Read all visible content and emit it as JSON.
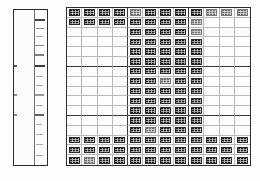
{
  "figure": {
    "kind": "two-panel-grayscale-array",
    "background_color": "#ffffff",
    "border_color": "#2e2e2e"
  },
  "left_panel": {
    "name": "marker-lane-panel",
    "x": 13,
    "y": 9,
    "width": 35,
    "height": 157,
    "divider_x_fraction": 0.62,
    "band_color": "#3a3a3a",
    "bands": [
      {
        "y_fraction": 0.055,
        "height": 0.013,
        "x_fraction": 0.64,
        "width": 0.3,
        "intensity": 0.95
      },
      {
        "y_fraction": 0.115,
        "height": 0.008,
        "x_fraction": 0.66,
        "width": 0.24,
        "intensity": 0.55
      },
      {
        "y_fraction": 0.168,
        "height": 0.008,
        "x_fraction": 0.66,
        "width": 0.22,
        "intensity": 0.45
      },
      {
        "y_fraction": 0.225,
        "height": 0.008,
        "x_fraction": 0.65,
        "width": 0.26,
        "intensity": 0.6
      },
      {
        "y_fraction": 0.285,
        "height": 0.009,
        "x_fraction": 0.65,
        "width": 0.27,
        "intensity": 0.65
      },
      {
        "y_fraction": 0.352,
        "height": 0.016,
        "x_fraction": 0.63,
        "width": 0.31,
        "intensity": 1.0
      },
      {
        "y_fraction": 0.352,
        "height": 0.014,
        "x_fraction": 0.0,
        "width": 0.1,
        "intensity": 0.85
      },
      {
        "y_fraction": 0.425,
        "height": 0.007,
        "x_fraction": 0.66,
        "width": 0.22,
        "intensity": 0.42
      },
      {
        "y_fraction": 0.485,
        "height": 0.007,
        "x_fraction": 0.66,
        "width": 0.22,
        "intensity": 0.4
      },
      {
        "y_fraction": 0.545,
        "height": 0.008,
        "x_fraction": 0.65,
        "width": 0.25,
        "intensity": 0.5
      },
      {
        "y_fraction": 0.545,
        "height": 0.01,
        "x_fraction": 0.0,
        "width": 0.08,
        "intensity": 0.6
      },
      {
        "y_fraction": 0.612,
        "height": 0.008,
        "x_fraction": 0.66,
        "width": 0.23,
        "intensity": 0.45
      },
      {
        "y_fraction": 0.672,
        "height": 0.012,
        "x_fraction": 0.64,
        "width": 0.28,
        "intensity": 0.8
      },
      {
        "y_fraction": 0.672,
        "height": 0.011,
        "x_fraction": 0.0,
        "width": 0.08,
        "intensity": 0.62
      },
      {
        "y_fraction": 0.735,
        "height": 0.007,
        "x_fraction": 0.66,
        "width": 0.2,
        "intensity": 0.38
      },
      {
        "y_fraction": 0.8,
        "height": 0.008,
        "x_fraction": 0.66,
        "width": 0.22,
        "intensity": 0.42
      },
      {
        "y_fraction": 0.866,
        "height": 0.007,
        "x_fraction": 0.66,
        "width": 0.22,
        "intensity": 0.4
      },
      {
        "y_fraction": 0.935,
        "height": 0.008,
        "x_fraction": 0.66,
        "width": 0.23,
        "intensity": 0.45
      }
    ]
  },
  "right_panel": {
    "name": "blot-array-panel",
    "x": 66,
    "y": 7,
    "width": 185,
    "height": 159,
    "columns": 12,
    "rows": 16,
    "major_column_breaks": [
      4,
      8
    ],
    "major_row_breaks": [
      6,
      11
    ],
    "cell_fill_color": "#1d1d1d",
    "grid_line_color": "#b9b9b9",
    "major_grid_line_color": "#3a3a3a",
    "occupancy": [
      [
        1,
        1,
        1,
        1,
        1,
        1,
        1,
        1,
        1,
        1,
        1,
        1
      ],
      [
        1,
        1,
        1,
        1,
        1,
        1,
        1,
        1,
        1,
        0,
        0,
        0
      ],
      [
        0,
        0,
        0,
        0,
        1,
        1,
        1,
        1,
        1,
        0,
        0,
        0
      ],
      [
        0,
        0,
        0,
        0,
        1,
        1,
        1,
        1,
        1,
        0,
        0,
        0
      ],
      [
        0,
        0,
        0,
        0,
        1,
        1,
        1,
        1,
        1,
        0,
        0,
        0
      ],
      [
        0,
        0,
        0,
        0,
        1,
        1,
        1,
        1,
        1,
        0,
        0,
        0
      ],
      [
        0,
        0,
        0,
        0,
        1,
        1,
        1,
        1,
        1,
        0,
        0,
        0
      ],
      [
        0,
        0,
        0,
        0,
        1,
        1,
        1,
        1,
        1,
        0,
        0,
        0
      ],
      [
        0,
        0,
        0,
        0,
        1,
        1,
        1,
        1,
        1,
        0,
        0,
        0
      ],
      [
        0,
        0,
        0,
        0,
        1,
        1,
        1,
        1,
        1,
        0,
        0,
        0
      ],
      [
        0,
        0,
        0,
        0,
        1,
        1,
        1,
        1,
        1,
        0,
        0,
        0
      ],
      [
        0,
        0,
        0,
        0,
        1,
        1,
        1,
        1,
        1,
        0,
        0,
        0
      ],
      [
        0,
        0,
        0,
        0,
        1,
        1,
        1,
        1,
        1,
        0,
        0,
        0
      ],
      [
        1,
        1,
        1,
        1,
        1,
        1,
        1,
        1,
        1,
        1,
        1,
        1
      ],
      [
        1,
        1,
        1,
        1,
        1,
        1,
        1,
        1,
        1,
        1,
        1,
        1
      ],
      [
        1,
        1,
        1,
        1,
        1,
        1,
        1,
        1,
        1,
        1,
        1,
        1
      ]
    ],
    "intensity": [
      [
        1.0,
        1.0,
        1.0,
        1.0,
        0.85,
        1.0,
        1.0,
        1.0,
        1.0,
        0.8,
        0.8,
        0.75
      ],
      [
        1.0,
        1.0,
        1.0,
        1.0,
        1.0,
        1.0,
        1.0,
        1.0,
        0.9,
        0,
        0,
        0
      ],
      [
        0,
        0,
        0,
        0,
        1.0,
        1.0,
        1.0,
        1.0,
        0.9,
        0,
        0,
        0
      ],
      [
        0,
        0,
        0,
        0,
        1.0,
        1.0,
        1.0,
        1.0,
        1.0,
        0,
        0,
        0
      ],
      [
        0,
        0,
        0,
        0,
        1.0,
        1.0,
        1.0,
        1.0,
        1.0,
        0,
        0,
        0
      ],
      [
        0,
        0,
        0,
        0,
        1.0,
        1.0,
        1.0,
        1.0,
        1.0,
        0,
        0,
        0
      ],
      [
        0,
        0,
        0,
        0,
        1.0,
        1.0,
        1.0,
        1.0,
        1.0,
        0,
        0,
        0
      ],
      [
        0,
        0,
        0,
        0,
        1.0,
        1.0,
        0.9,
        1.0,
        1.0,
        0,
        0,
        0
      ],
      [
        0,
        0,
        0,
        0,
        1.0,
        1.0,
        1.0,
        1.0,
        1.0,
        0,
        0,
        0
      ],
      [
        0,
        0,
        0,
        0,
        1.0,
        1.0,
        1.0,
        1.0,
        1.0,
        0,
        0,
        0
      ],
      [
        0,
        0,
        0,
        0,
        1.0,
        1.0,
        1.0,
        1.0,
        1.0,
        0,
        0,
        0
      ],
      [
        0,
        0,
        0,
        0,
        1.0,
        1.0,
        1.0,
        1.0,
        1.0,
        0,
        0,
        0
      ],
      [
        0,
        0,
        0,
        0,
        1.0,
        0.9,
        1.0,
        1.0,
        1.0,
        0,
        0,
        0
      ],
      [
        1.0,
        1.0,
        1.0,
        1.0,
        1.0,
        1.0,
        1.0,
        1.0,
        1.0,
        1.0,
        1.0,
        1.0
      ],
      [
        1.0,
        1.0,
        1.0,
        1.0,
        1.0,
        1.0,
        1.0,
        1.0,
        1.0,
        1.0,
        1.0,
        1.0
      ],
      [
        1.0,
        0.9,
        1.0,
        1.0,
        1.0,
        1.0,
        1.0,
        1.0,
        1.0,
        1.0,
        1.0,
        1.0
      ]
    ]
  }
}
